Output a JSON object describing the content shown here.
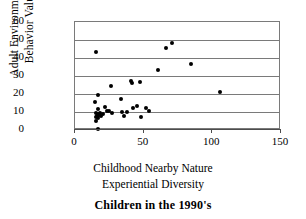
{
  "caption": "Children in the 1990's",
  "chart_data": {
    "type": "scatter",
    "title": "Children in the 1990's",
    "xlabel": "Childhood Nearby Nature Experiential Diversity",
    "xlabel_lines": [
      "Childhood Nearby Nature",
      "Experiential Diversity"
    ],
    "ylabel": "Adult Environmental Behavior Value",
    "ylabel_lines": [
      "Adult Environmental",
      "Behavior Value"
    ],
    "xlim": [
      0,
      150
    ],
    "ylim": [
      0,
      60
    ],
    "xticks": [
      0,
      50,
      100,
      150
    ],
    "yticks": [
      0,
      10,
      20,
      30,
      40,
      50,
      60
    ],
    "grid": "horizontal",
    "legend": null,
    "marker": "filled-circle",
    "marker_color": "#000000",
    "points": [
      {
        "x": 14.5,
        "y": 15.5
      },
      {
        "x": 15.0,
        "y": 43.5
      },
      {
        "x": 15.5,
        "y": 9.5
      },
      {
        "x": 15.5,
        "y": 7.0
      },
      {
        "x": 15.5,
        "y": 5.0
      },
      {
        "x": 16.0,
        "y": 8.0
      },
      {
        "x": 16.5,
        "y": 11.5
      },
      {
        "x": 16.5,
        "y": 9.0
      },
      {
        "x": 17.0,
        "y": 19.5
      },
      {
        "x": 17.0,
        "y": 6.5
      },
      {
        "x": 17.0,
        "y": 0.5
      },
      {
        "x": 17.5,
        "y": 8.5
      },
      {
        "x": 18.0,
        "y": 9.5
      },
      {
        "x": 19.0,
        "y": 8.0
      },
      {
        "x": 20.5,
        "y": 9.0
      },
      {
        "x": 22.0,
        "y": 13.0
      },
      {
        "x": 23.5,
        "y": 10.5
      },
      {
        "x": 25.0,
        "y": 10.5
      },
      {
        "x": 26.5,
        "y": 24.5
      },
      {
        "x": 27.0,
        "y": 9.5
      },
      {
        "x": 33.5,
        "y": 17.5
      },
      {
        "x": 34.0,
        "y": 10.0
      },
      {
        "x": 36.0,
        "y": 8.0
      },
      {
        "x": 38.0,
        "y": 10.0
      },
      {
        "x": 40.5,
        "y": 27.0
      },
      {
        "x": 41.5,
        "y": 26.0
      },
      {
        "x": 42.0,
        "y": 12.5
      },
      {
        "x": 45.0,
        "y": 13.5
      },
      {
        "x": 47.0,
        "y": 26.5
      },
      {
        "x": 48.0,
        "y": 7.5
      },
      {
        "x": 52.0,
        "y": 12.5
      },
      {
        "x": 54.0,
        "y": 10.5
      },
      {
        "x": 60.5,
        "y": 33.5
      },
      {
        "x": 66.5,
        "y": 45.5
      },
      {
        "x": 70.5,
        "y": 48.5
      },
      {
        "x": 84.5,
        "y": 36.5
      },
      {
        "x": 105.5,
        "y": 21.0
      }
    ]
  }
}
